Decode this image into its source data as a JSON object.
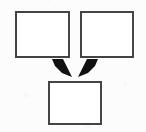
{
  "diagram": {
    "type": "flow-convergence",
    "background_color": "#fcfcfc",
    "box_fill_color": "#ffffff",
    "box_border_color": "#444444",
    "arrow_color": "#111111",
    "nodes": [
      {
        "id": "source-left",
        "label": "",
        "x": 15,
        "y": 11,
        "width": 55,
        "height": 47
      },
      {
        "id": "source-right",
        "label": "",
        "x": 80,
        "y": 11,
        "width": 54,
        "height": 47
      },
      {
        "id": "target-bottom",
        "label": "",
        "x": 48,
        "y": 81,
        "width": 54,
        "height": 44
      }
    ],
    "arrows": [
      {
        "id": "arrow-left-to-bottom",
        "from": "source-left",
        "to": "target-bottom",
        "direction": "down-right",
        "label": "",
        "points": "52,59 63,59 65,63 72,77 62,73 55,66"
      },
      {
        "id": "arrow-right-to-bottom",
        "from": "source-right",
        "to": "target-bottom",
        "direction": "down-left",
        "label": "",
        "points": "98,59 87,59 85,63 78,77 88,73 95,66"
      }
    ]
  }
}
